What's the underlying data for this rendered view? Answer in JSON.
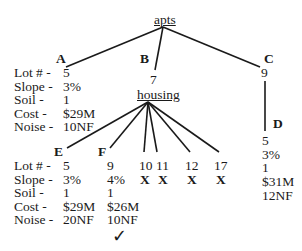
{
  "root": {
    "label": "apts"
  },
  "row_labels": [
    "Lot # -",
    "Slope -",
    "Soil  -",
    "Cost  -",
    "Noise -"
  ],
  "nodes": {
    "A": {
      "label": "A",
      "values": [
        "5",
        "3%",
        "1",
        "$29M",
        "10NF"
      ]
    },
    "B": {
      "label": "B",
      "lot": "7",
      "sub_label": "housing"
    },
    "C": {
      "label": "C",
      "lot": "9"
    },
    "D": {
      "label": "D",
      "values": [
        "5",
        "3%",
        "1",
        "$31M",
        "12NF"
      ]
    },
    "E": {
      "label": "E",
      "values": [
        "5",
        "3%",
        "1",
        "$29M",
        "20NF"
      ]
    },
    "F": {
      "label": "F",
      "values": [
        "9",
        "4%",
        "1",
        "$26M",
        "10NF"
      ],
      "selected": true
    },
    "rejected": [
      {
        "lot": "10",
        "mark": "X"
      },
      {
        "lot": "11",
        "mark": "X"
      },
      {
        "lot": "12",
        "mark": "X"
      },
      {
        "lot": "17",
        "mark": "X"
      }
    ]
  },
  "check_mark": "✓"
}
